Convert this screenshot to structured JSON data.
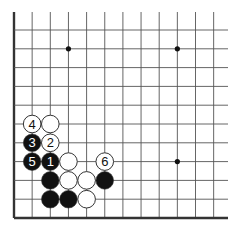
{
  "diagram": {
    "type": "go-board-fragment",
    "corner": "bottom-left",
    "columns_visible": 12,
    "rows_visible": 12,
    "grid": {
      "x0": 14,
      "dx": 18.15,
      "y_bottom": 218,
      "dy": 18.8,
      "right_extent": 228,
      "top_extent": 12
    },
    "colors": {
      "line": "#555555",
      "edge": "#333333",
      "black_stone": "#111111",
      "white_stone": "#ffffff",
      "stone_outline": "#333333"
    },
    "star_points": [
      {
        "col": 3,
        "row": 9
      },
      {
        "col": 9,
        "row": 9
      },
      {
        "col": 9,
        "row": 3
      }
    ],
    "stones": [
      {
        "color": "white",
        "col": 1,
        "row": 5,
        "label": "4"
      },
      {
        "color": "white",
        "col": 2,
        "row": 5,
        "label": ""
      },
      {
        "color": "black",
        "col": 1,
        "row": 4,
        "label": "3"
      },
      {
        "color": "white",
        "col": 2,
        "row": 4,
        "label": "2"
      },
      {
        "color": "black",
        "col": 1,
        "row": 3,
        "label": "5"
      },
      {
        "color": "black",
        "col": 2,
        "row": 3,
        "label": "1"
      },
      {
        "color": "white",
        "col": 3,
        "row": 3,
        "label": ""
      },
      {
        "color": "white",
        "col": 5,
        "row": 3,
        "label": "6"
      },
      {
        "color": "black",
        "col": 2,
        "row": 2,
        "label": ""
      },
      {
        "color": "white",
        "col": 3,
        "row": 2,
        "label": ""
      },
      {
        "color": "white",
        "col": 4,
        "row": 2,
        "label": ""
      },
      {
        "color": "black",
        "col": 5,
        "row": 2,
        "label": ""
      },
      {
        "color": "black",
        "col": 2,
        "row": 1,
        "label": ""
      },
      {
        "color": "black",
        "col": 3,
        "row": 1,
        "label": ""
      },
      {
        "color": "white",
        "col": 4,
        "row": 1,
        "label": ""
      }
    ]
  }
}
